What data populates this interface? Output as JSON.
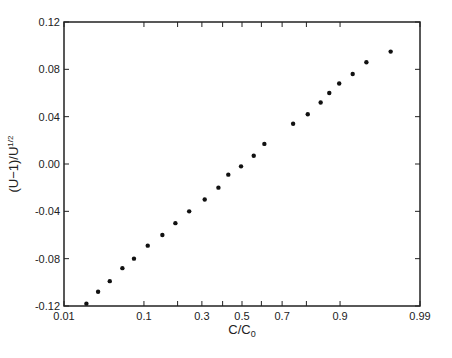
{
  "chart_data": {
    "type": "scatter",
    "title": "",
    "xlabel": "C/C0",
    "xlabel_main": "C/C",
    "xlabel_sub": "0",
    "ylabel": "(U−1)/U^1/2",
    "ylabel_main": "(U−1)/U",
    "ylabel_sup": "1/2",
    "x_scale": "probability",
    "xlim": [
      0.01,
      0.99
    ],
    "ylim": [
      -0.12,
      0.12
    ],
    "grid": false,
    "legend": null,
    "x_ticks": [
      0.01,
      0.1,
      0.2,
      0.3,
      0.4,
      0.5,
      0.6,
      0.7,
      0.8,
      0.9,
      0.99
    ],
    "x_tick_labels": [
      {
        "value": 0.01,
        "label": "0.01"
      },
      {
        "value": 0.1,
        "label": "0.1"
      },
      {
        "value": 0.3,
        "label": "0.3"
      },
      {
        "value": 0.5,
        "label": "0.5"
      },
      {
        "value": 0.7,
        "label": "0.7"
      },
      {
        "value": 0.9,
        "label": "0.9"
      },
      {
        "value": 0.99,
        "label": "0.99"
      }
    ],
    "y_ticks": [
      {
        "value": 0.12,
        "label": "0.12"
      },
      {
        "value": 0.08,
        "label": "0.08"
      },
      {
        "value": 0.04,
        "label": "0.04"
      },
      {
        "value": 0.0,
        "label": "0.00"
      },
      {
        "value": -0.04,
        "label": "-0.04"
      },
      {
        "value": -0.08,
        "label": "-0.08"
      },
      {
        "value": -0.12,
        "label": "-0.12"
      }
    ],
    "series": [
      {
        "name": "data",
        "marker": "filled-circle",
        "color": "#111111",
        "x": [
          0.021,
          0.03,
          0.042,
          0.059,
          0.079,
          0.109,
          0.149,
          0.192,
          0.245,
          0.313,
          0.379,
          0.429,
          0.495,
          0.561,
          0.615,
          0.748,
          0.805,
          0.848,
          0.873,
          0.898,
          0.926,
          0.948,
          0.974
        ],
        "y": [
          -0.118,
          -0.108,
          -0.099,
          -0.088,
          -0.08,
          -0.069,
          -0.06,
          -0.05,
          -0.04,
          -0.03,
          -0.02,
          -0.009,
          -0.002,
          0.007,
          0.017,
          0.034,
          0.042,
          0.052,
          0.06,
          0.068,
          0.076,
          0.086,
          0.095
        ]
      }
    ]
  },
  "colors": {
    "axis": "#222222",
    "marker": "#111111",
    "background": "#ffffff"
  }
}
